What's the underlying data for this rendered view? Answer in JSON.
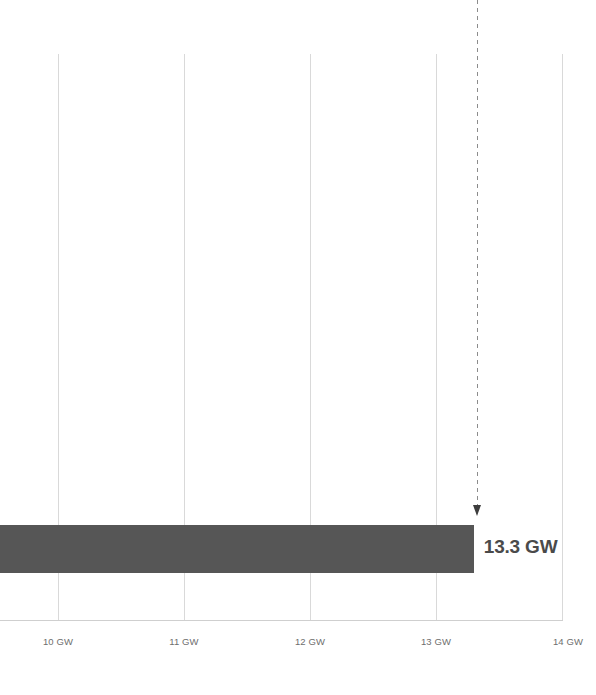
{
  "chart_data": {
    "type": "bar",
    "orientation": "horizontal",
    "title": "",
    "subtitle": "",
    "xlabel": "",
    "ylabel": "",
    "categories": [
      ""
    ],
    "values": [
      13.3
    ],
    "value_unit": "GW",
    "data_labels": [
      "13.3 GW"
    ],
    "xlim": [
      9.54,
      14.0
    ],
    "grid": true,
    "grid_axis": "x",
    "legend": "none",
    "axis": {
      "ticks": [
        {
          "value": 10,
          "label": "10 GW",
          "x_px": 58
        },
        {
          "value": 11,
          "label": "11 GW",
          "x_px": 184
        },
        {
          "value": 12,
          "label": "12 GW",
          "x_px": 310
        },
        {
          "value": 13,
          "label": "13 GW",
          "x_px": 436
        },
        {
          "value": 14,
          "label": "14 GW",
          "x_px": 562
        }
      ]
    },
    "annotations": [
      {
        "type": "dashed-vertical-arrow",
        "value": 13.3,
        "label": "",
        "x_px": 477,
        "points_to": "bar-end"
      }
    ],
    "colors": {
      "bar": "#565656",
      "gridline": "#d9d9d9",
      "axis_line": "#cfcfcf",
      "tick_label": "#6e6e6e",
      "value_label": "#4a4a4a",
      "annotation_line": "#8c8c8c",
      "background": "#ffffff"
    }
  },
  "chart": {
    "bar_label": "13.3 GW",
    "ticks": [
      {
        "label": "10 GW"
      },
      {
        "label": "11 GW"
      },
      {
        "label": "12 GW"
      },
      {
        "label": "13 GW"
      },
      {
        "label": "14 GW"
      }
    ]
  }
}
